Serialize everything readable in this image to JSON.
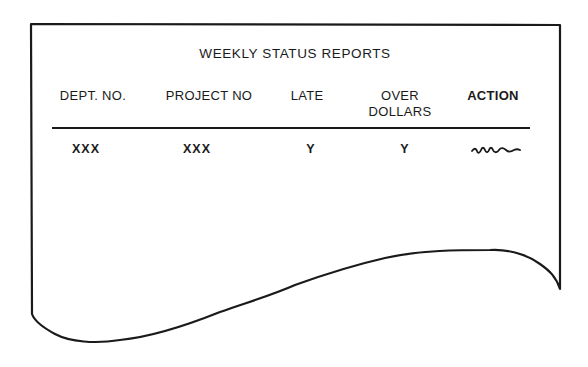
{
  "report": {
    "title": "WEEKLY STATUS REPORTS",
    "columns": [
      {
        "label_lines": [
          "DEPT. NO."
        ]
      },
      {
        "label_lines": [
          "PROJECT NO"
        ]
      },
      {
        "label_lines": [
          "LATE"
        ]
      },
      {
        "label_lines": [
          "OVER",
          "DOLLARS"
        ]
      },
      {
        "label_lines": [
          "ACTION"
        ]
      }
    ],
    "rows": [
      {
        "dept_no": "XXX",
        "project_no": "XXX",
        "late": "Y",
        "over_dollars": "Y",
        "action": "handwritten-squiggle-icon"
      }
    ]
  },
  "colors": {
    "ink": "#1a1a1a",
    "paper": "#ffffff"
  }
}
